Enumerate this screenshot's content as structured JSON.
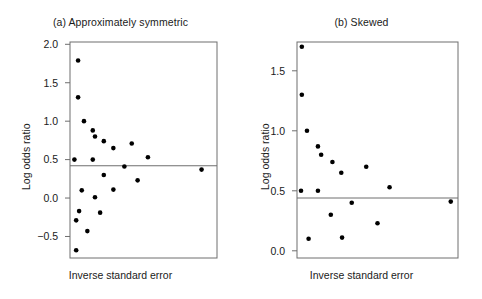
{
  "figure": {
    "background": "#ffffff",
    "point_color": "#000000",
    "axis_color": "#6e6e6e",
    "text_color": "#1a1a1a"
  },
  "panels": [
    {
      "key": "a",
      "title": "(a) Approximately symmetric",
      "xlabel": "Inverse standard error",
      "ylabel": "Log odds ratio"
    },
    {
      "key": "b",
      "title": "(b) Skewed",
      "xlabel": "Inverse standard error",
      "ylabel": "Log odds ratio"
    }
  ],
  "chart_data": [
    {
      "type": "scatter",
      "title": "(a) Approximately symmetric",
      "xlabel": "Inverse standard error",
      "ylabel": "Log odds ratio",
      "xlim": [
        0,
        10
      ],
      "ylim": [
        -0.78,
        2.03
      ],
      "yticks": [
        2.0,
        1.5,
        1.0,
        0.5,
        0.0,
        -0.5
      ],
      "ytick_labels": [
        "2.0",
        "1.5",
        "1.0",
        "0.5",
        "0.0",
        "-0.5"
      ],
      "xticks": [],
      "xtick_labels": [],
      "grid": false,
      "legend": false,
      "reference_line": {
        "orientation": "horizontal",
        "y": 0.42
      },
      "points": [
        {
          "x": 0.55,
          "y": 1.79
        },
        {
          "x": 0.55,
          "y": 1.31
        },
        {
          "x": 0.95,
          "y": 1.0
        },
        {
          "x": 1.55,
          "y": 0.88
        },
        {
          "x": 1.7,
          "y": 0.8
        },
        {
          "x": 2.3,
          "y": 0.74
        },
        {
          "x": 2.95,
          "y": 0.65
        },
        {
          "x": 4.2,
          "y": 0.71
        },
        {
          "x": 5.3,
          "y": 0.53
        },
        {
          "x": 0.3,
          "y": 0.5
        },
        {
          "x": 1.55,
          "y": 0.5
        },
        {
          "x": 3.7,
          "y": 0.41
        },
        {
          "x": 8.95,
          "y": 0.37
        },
        {
          "x": 2.3,
          "y": 0.3
        },
        {
          "x": 4.6,
          "y": 0.23
        },
        {
          "x": 0.8,
          "y": 0.1
        },
        {
          "x": 2.95,
          "y": 0.11
        },
        {
          "x": 1.7,
          "y": 0.01
        },
        {
          "x": 0.62,
          "y": -0.17
        },
        {
          "x": 2.05,
          "y": -0.19
        },
        {
          "x": 0.42,
          "y": -0.29
        },
        {
          "x": 1.18,
          "y": -0.43
        },
        {
          "x": 0.42,
          "y": -0.68
        }
      ]
    },
    {
      "type": "scatter",
      "title": "(b) Skewed",
      "xlabel": "Inverse standard error",
      "ylabel": "Log odds ratio",
      "xlim": [
        0,
        10
      ],
      "ylim": [
        -0.06,
        1.74
      ],
      "yticks": [
        1.5,
        1.0,
        0.5,
        0.0
      ],
      "ytick_labels": [
        "1.5",
        "1.0",
        "0.5",
        "0.0"
      ],
      "xticks": [],
      "xtick_labels": [],
      "grid": false,
      "legend": false,
      "reference_line": {
        "orientation": "horizontal",
        "y": 0.44
      },
      "points": [
        {
          "x": 0.3,
          "y": 1.7
        },
        {
          "x": 0.3,
          "y": 1.3
        },
        {
          "x": 0.62,
          "y": 1.0
        },
        {
          "x": 1.3,
          "y": 0.87
        },
        {
          "x": 1.5,
          "y": 0.8
        },
        {
          "x": 2.2,
          "y": 0.74
        },
        {
          "x": 2.75,
          "y": 0.65
        },
        {
          "x": 4.3,
          "y": 0.7
        },
        {
          "x": 5.75,
          "y": 0.53
        },
        {
          "x": 0.25,
          "y": 0.5
        },
        {
          "x": 1.3,
          "y": 0.5
        },
        {
          "x": 3.4,
          "y": 0.4
        },
        {
          "x": 9.55,
          "y": 0.41
        },
        {
          "x": 2.1,
          "y": 0.3
        },
        {
          "x": 5.0,
          "y": 0.23
        },
        {
          "x": 0.72,
          "y": 0.1
        },
        {
          "x": 2.8,
          "y": 0.11
        }
      ]
    }
  ]
}
